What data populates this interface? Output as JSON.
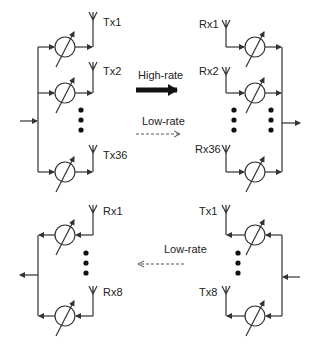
{
  "diagram": {
    "top_left": {
      "labels": [
        "Tx1",
        "Tx2",
        "Tx36"
      ],
      "role": "transmitter array"
    },
    "top_right": {
      "labels": [
        "Rx1",
        "Rx2",
        "Rx36"
      ],
      "role": "receiver array"
    },
    "bottom_left": {
      "labels": [
        "Rx1",
        "Rx8"
      ],
      "role": "receiver array"
    },
    "bottom_right": {
      "labels": [
        "Tx1",
        "Tx8"
      ],
      "role": "transmitter array"
    },
    "links": {
      "high_rate": "High-rate",
      "low_rate_forward": "Low-rate",
      "low_rate_return": "Low-rate"
    },
    "colors": {
      "line": "#333333",
      "text": "#222222",
      "background": "#ffffff"
    }
  }
}
